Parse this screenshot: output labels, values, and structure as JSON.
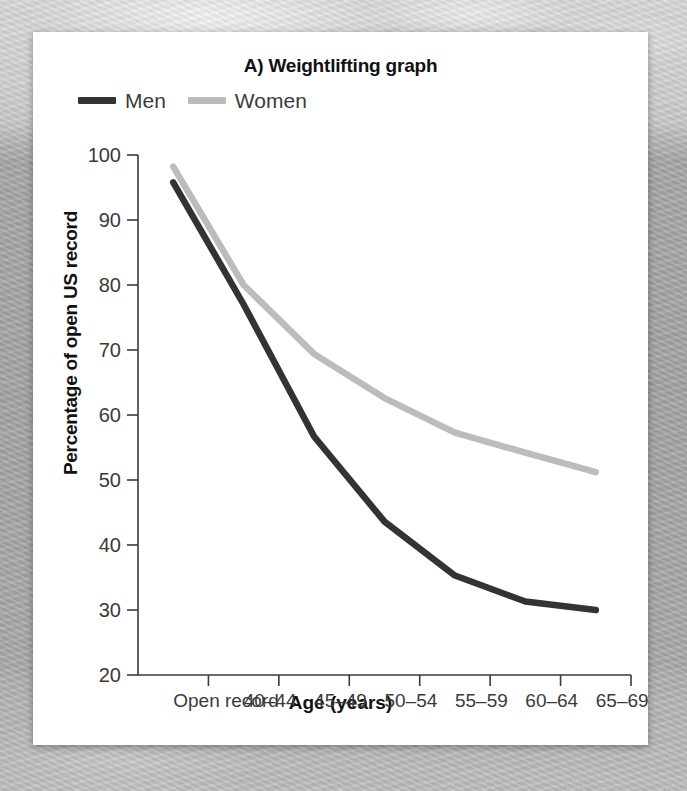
{
  "figure": {
    "title": "A) Weightlifting graph",
    "background_color": "#a6a6a6",
    "card_color": "#ffffff"
  },
  "chart_data": {
    "type": "line",
    "title": "A) Weightlifting graph",
    "xlabel": "Age (years)",
    "ylabel": "Percentage of open US record",
    "categories": [
      "Open record",
      "40–44",
      "45–49",
      "50–54",
      "55–59",
      "60–64",
      "65–69"
    ],
    "ylim": [
      20,
      100
    ],
    "yticks": [
      20,
      30,
      40,
      50,
      60,
      70,
      80,
      90,
      100
    ],
    "ytick_labels": [
      "20",
      "30",
      "40",
      "50",
      "60",
      "70",
      "80",
      "90",
      "100"
    ],
    "grid": false,
    "legend_position": "top-left",
    "series": [
      {
        "name": "Men",
        "color": "#333333",
        "values": [
          95.8,
          77.0,
          56.7,
          43.6,
          35.3,
          31.3,
          30.0
        ]
      },
      {
        "name": "Women",
        "color": "#bcbcbc",
        "values": [
          98.2,
          80.0,
          69.4,
          62.6,
          57.3,
          54.2,
          51.2
        ]
      }
    ]
  },
  "legend": {
    "items": [
      {
        "label": "Men",
        "color": "#333333"
      },
      {
        "label": "Women",
        "color": "#bcbcbc"
      }
    ]
  }
}
